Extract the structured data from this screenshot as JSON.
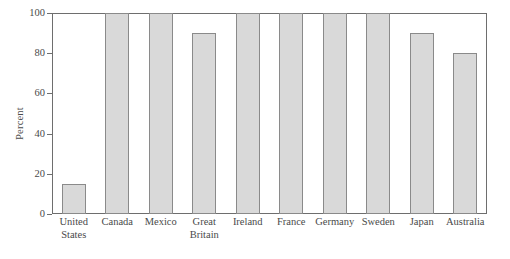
{
  "chart_data": {
    "type": "bar",
    "title": "",
    "subtitle": "",
    "xlabel": "",
    "ylabel": "Percent",
    "ylim": [
      0,
      100
    ],
    "yticks": [
      0,
      20,
      40,
      60,
      80,
      100
    ],
    "ytick_labels": [
      "0",
      "20",
      "40",
      "60",
      "80",
      "100"
    ],
    "grid": false,
    "legend": false,
    "legend_position": "none",
    "bar_color": "#d9d9d9",
    "bar_edge_color": "#8a8a8a",
    "axis_color": "#6e6e6e",
    "background_color": "#ffffff",
    "categories": [
      "United States",
      "Canada",
      "Mexico",
      "Great Britain",
      "Ireland",
      "France",
      "Germany",
      "Sweden",
      "Japan",
      "Australia"
    ],
    "category_lines": [
      [
        "United",
        "States"
      ],
      [
        "Canada",
        ""
      ],
      [
        "Mexico",
        ""
      ],
      [
        "Great",
        "Britain"
      ],
      [
        "Ireland",
        ""
      ],
      [
        "France",
        ""
      ],
      [
        "Germany",
        ""
      ],
      [
        "Sweden",
        ""
      ],
      [
        "Japan",
        ""
      ],
      [
        "Australia",
        ""
      ]
    ],
    "values": [
      15,
      100,
      100,
      90,
      100,
      100,
      100,
      100,
      90,
      80
    ]
  }
}
